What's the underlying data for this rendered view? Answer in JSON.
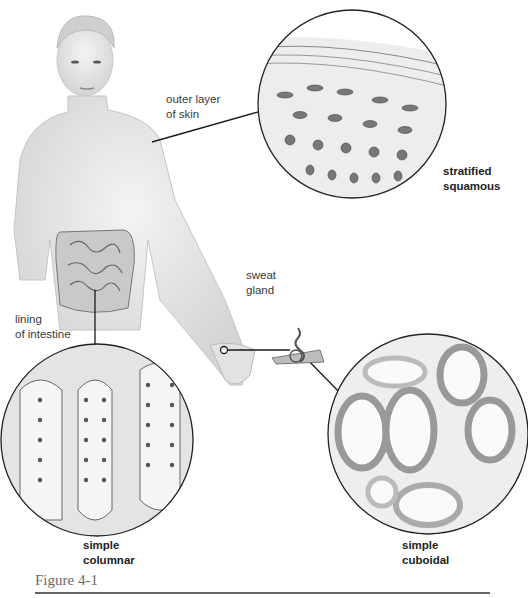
{
  "figure": {
    "caption": "Figure 4-1"
  },
  "labels": {
    "outer_skin": {
      "line1": "outer layer",
      "line2": "of skin"
    },
    "stratified": {
      "line1": "stratified",
      "line2": "squamous"
    },
    "sweat_gland": {
      "line1": "sweat",
      "line2": "gland"
    },
    "intestine": {
      "line1": "lining",
      "line2": "of intestine"
    },
    "columnar": {
      "line1": "simple",
      "line2": "columnar"
    },
    "cuboidal": {
      "line1": "simple",
      "line2": "cuboidal"
    }
  },
  "colors": {
    "skin": "#e6e6e6",
    "line": "#1a1a1a",
    "tissue": "#d9d9d9",
    "rule": "#666666"
  }
}
